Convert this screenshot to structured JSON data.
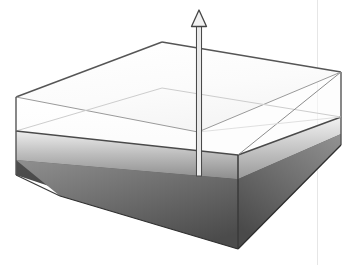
{
  "figure": {
    "title": "",
    "background_color": "#ffffff",
    "canvas": {
      "width": 355,
      "height": 265
    }
  },
  "diagram": {
    "kind": "3d-box-with-vertical-arrow",
    "colors": {
      "outer_box_stroke": "#4d4d4d",
      "outer_box_fill": "#ffffff",
      "inner_faint_stroke": "#cfcfcf",
      "slab_top_light": "#f2f2f2",
      "slab_top_dark": "#8f8f8f",
      "slab_side_light": "#c9c9c9",
      "slab_side_dark": "#6e6e6e",
      "base_top_light": "#9a9a9a",
      "base_top_dark": "#4a4a4a",
      "base_front_dark": "#3f3f3f",
      "arrow_stroke": "#404040",
      "arrow_fill": "#f0f0f0",
      "guide_line": "#e3e3e3"
    },
    "elements": [
      {
        "name": "outer-box",
        "label": "Outer transparent box"
      },
      {
        "name": "gray-slab",
        "label": "Shaded interior slab"
      },
      {
        "name": "dark-base",
        "label": "Dark base block"
      },
      {
        "name": "vertical-arrow",
        "label": "Upward vertical arrow"
      },
      {
        "name": "guide-line",
        "label": "Faint vertical guide line"
      }
    ],
    "geometry": {
      "outer_top": {
        "left": [
          16,
          97
        ],
        "back": [
          162,
          42
        ],
        "right": [
          341,
          72
        ],
        "front": [
          198,
          130
        ]
      },
      "outer_verticals": {
        "left": [
          [
            16,
            97
          ],
          [
            16,
            175
          ]
        ],
        "right": [
          [
            341,
            72
          ],
          [
            341,
            145
          ]
        ]
      },
      "slab_top": {
        "left": [
          16,
          131
        ],
        "back": [
          162,
          88
        ],
        "right": [
          341,
          117
        ],
        "front": [
          238,
          155
        ]
      },
      "base_top": {
        "left": [
          16,
          160
        ],
        "back": [
          162,
          107
        ],
        "right": [
          341,
          134
        ],
        "front": [
          238,
          179
        ]
      },
      "base_bottom": {
        "left": [
          16,
          175
        ],
        "front": [
          238,
          249
        ],
        "right": [
          341,
          145
        ]
      },
      "arrow": {
        "x": 199,
        "tip_y": 10,
        "tail_y": 176,
        "head_width": 15,
        "head_height": 16
      },
      "guide_x": 317
    }
  }
}
